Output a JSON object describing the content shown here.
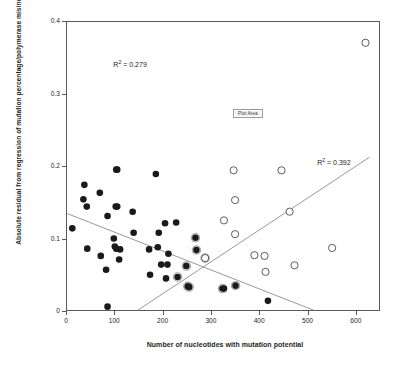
{
  "chart_data": {
    "type": "scatter",
    "title": "",
    "xlabel": "Number of nucleotides with mutation potential",
    "ylabel": "Absolute residual from regression of mutation percentage/polymerase misincorporation",
    "xlim": [
      0,
      650
    ],
    "ylim": [
      0,
      0.4
    ],
    "xticks": [
      0,
      100,
      200,
      300,
      400,
      500,
      600
    ],
    "yticks": [
      0,
      0.1,
      0.2,
      0.3,
      0.4
    ],
    "xtick_labels": [
      "0",
      "100",
      "200",
      "300",
      "400",
      "500",
      "600"
    ],
    "ytick_labels": [
      "0",
      "0.1",
      "0.2",
      "0.3",
      "0.4"
    ],
    "grid": false,
    "legend": "none",
    "series": [
      {
        "name": "filled",
        "marker": "filled-circle",
        "color": "#1a1a1a",
        "points": [
          [
            13,
            0.114
          ],
          [
            38,
            0.174
          ],
          [
            36,
            0.154
          ],
          [
            43,
            0.144
          ],
          [
            44,
            0.086
          ],
          [
            70,
            0.163
          ],
          [
            72,
            0.076
          ],
          [
            83,
            0.057
          ],
          [
            86,
            0.131
          ],
          [
            86,
            0.006
          ],
          [
            99,
            0.1
          ],
          [
            101,
            0.089
          ],
          [
            104,
            0.195
          ],
          [
            106,
            0.195
          ],
          [
            106,
            0.144
          ],
          [
            104,
            0.086
          ],
          [
            103,
            0.144
          ],
          [
            110,
            0.071
          ],
          [
            112,
            0.085
          ],
          [
            138,
            0.137
          ],
          [
            140,
            0.108
          ],
          [
            172,
            0.085
          ],
          [
            174,
            0.05
          ],
          [
            186,
            0.189
          ],
          [
            190,
            0.088
          ],
          [
            192,
            0.108
          ],
          [
            197,
            0.064
          ],
          [
            205,
            0.121
          ],
          [
            207,
            0.045
          ],
          [
            210,
            0.064
          ],
          [
            212,
            0.079
          ],
          [
            228,
            0.122
          ],
          [
            231,
            0.047
          ],
          [
            249,
            0.062
          ],
          [
            252,
            0.034
          ],
          [
            255,
            0.033
          ],
          [
            268,
            0.101
          ],
          [
            270,
            0.084
          ],
          [
            288,
            0.073
          ],
          [
            324,
            0.031
          ],
          [
            327,
            0.031
          ],
          [
            351,
            0.035
          ],
          [
            418,
            0.014
          ]
        ]
      },
      {
        "name": "open",
        "marker": "open-circle",
        "color": "#4d4d4d",
        "points": [
          [
            288,
            0.073
          ],
          [
            327,
            0.125
          ],
          [
            347,
            0.194
          ],
          [
            350,
            0.153
          ],
          [
            350,
            0.106
          ],
          [
            390,
            0.077
          ],
          [
            411,
            0.076
          ],
          [
            413,
            0.054
          ],
          [
            446,
            0.194
          ],
          [
            463,
            0.137
          ],
          [
            473,
            0.063
          ],
          [
            551,
            0.087
          ],
          [
            620,
            0.37
          ]
        ]
      }
    ],
    "trendlines": [
      {
        "name": "descending-trendline",
        "r2_label": "R² = 0.279",
        "r2_value": 0.279,
        "x0": 0,
        "y0": 0.135,
        "x1": 517,
        "y1": 0.0
      },
      {
        "name": "ascending-trendline",
        "r2_label": "R² = 0.392",
        "r2_value": 0.392,
        "x0": 146,
        "y0": 0.0,
        "x1": 628,
        "y1": 0.212
      }
    ],
    "annotations": [
      {
        "name": "r2-descending",
        "text_prefix": "R",
        "text_sup": "2",
        "text_suffix": " = 0.279",
        "x": 98,
        "y": 0.348
      },
      {
        "name": "r2-ascending",
        "text_prefix": "R",
        "text_sup": "2",
        "text_suffix": " = 0.392",
        "x": 520,
        "y": 0.212
      },
      {
        "name": "plot-area-tooltip",
        "text": "Plot Area",
        "x": 348,
        "y": 0.278
      }
    ]
  },
  "labels": {
    "r2_descending": "R",
    "r2_descending_sup": "2",
    "r2_descending_rest": " = 0.279",
    "r2_ascending": "R",
    "r2_ascending_sup": "2",
    "r2_ascending_rest": " = 0.392",
    "plot_area": "Plot Area"
  },
  "colors": {
    "frame": "#58595b",
    "filled_marker": "#1a1a1a",
    "open_marker": "#4d4d4d",
    "trendline": "#7f7f7f",
    "text": "#231f20"
  }
}
